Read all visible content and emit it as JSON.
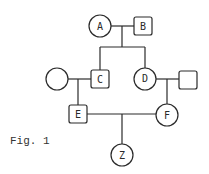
{
  "diagram": {
    "type": "pedigree",
    "caption": "Fig. 1",
    "individuals": [
      {
        "id": "A",
        "label": "A",
        "sex": "female",
        "shape": "circle"
      },
      {
        "id": "B",
        "label": "B",
        "sex": "male",
        "shape": "square"
      },
      {
        "id": "C",
        "label": "C",
        "sex": "male",
        "shape": "square"
      },
      {
        "id": "D",
        "label": "D",
        "sex": "female",
        "shape": "circle"
      },
      {
        "id": "C_spouse",
        "label": "",
        "sex": "female",
        "shape": "circle"
      },
      {
        "id": "D_spouse",
        "label": "",
        "sex": "male",
        "shape": "square"
      },
      {
        "id": "E",
        "label": "E",
        "sex": "male",
        "shape": "square"
      },
      {
        "id": "F",
        "label": "F",
        "sex": "female",
        "shape": "circle"
      },
      {
        "id": "Z",
        "label": "Z",
        "sex": "female",
        "shape": "circle"
      }
    ],
    "unions": [
      {
        "partners": [
          "A",
          "B"
        ],
        "children": [
          "C",
          "D"
        ]
      },
      {
        "partners": [
          "C_spouse",
          "C"
        ],
        "children": [
          "E"
        ]
      },
      {
        "partners": [
          "D",
          "D_spouse"
        ],
        "children": [
          "F"
        ]
      },
      {
        "partners": [
          "E",
          "F"
        ],
        "children": [
          "Z"
        ]
      }
    ]
  }
}
